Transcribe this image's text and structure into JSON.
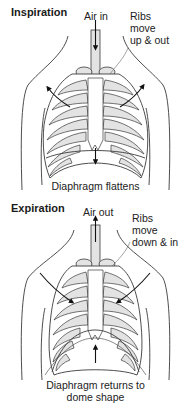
{
  "colors": {
    "background": "#ffffff",
    "outline": "#3a3a3a",
    "rib_fill": "#e3e3e3",
    "arrow": "#111111"
  },
  "inspiration": {
    "title": "Inspiration",
    "air_label": "Air in",
    "air_direction": "down",
    "ribs_label_line1": "Ribs",
    "ribs_label_line2": "move",
    "ribs_label_line3": "up & out",
    "diaphragm_label": "Diaphragm flattens",
    "diaphragm_arrow_direction": "down",
    "rib_arrows": "outward-up"
  },
  "expiration": {
    "title": "Expiration",
    "air_label": "Air out",
    "air_direction": "up",
    "ribs_label_line1": "Ribs",
    "ribs_label_line2": "move",
    "ribs_label_line3": "down & in",
    "diaphragm_label_line1": "Diaphragm returns to",
    "diaphragm_label_line2": "dome shape",
    "diaphragm_arrow_direction": "up",
    "rib_arrows": "inward-down"
  }
}
